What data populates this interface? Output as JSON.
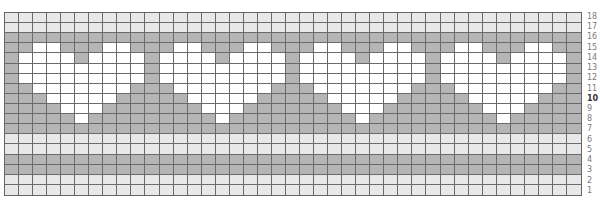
{
  "chart_data": {
    "type": "heatmap",
    "title": "",
    "columns": 41,
    "rows": 18,
    "row_labels": [
      "18",
      "17",
      "16",
      "15",
      "14",
      "13",
      "12",
      "11",
      "10",
      "9",
      "8",
      "7",
      "6",
      "5",
      "4",
      "3",
      "2",
      "1"
    ],
    "highlighted_row_label": "10",
    "colors": {
      "L": "#e8e8e8",
      "D": "#b5b5b5",
      "W": "#ffffff"
    },
    "legend": {
      "L": "light gray (background stripe)",
      "D": "dark gray (contrast)",
      "W": "white (heart motif)"
    },
    "heart_motif": {
      "width": 9,
      "repeat_every": 10,
      "first_column": 1,
      "count": 4,
      "rows_top_to_bottom": {
        "15": [
          1,
          2,
          6,
          7
        ],
        "14": [
          0,
          1,
          2,
          3,
          5,
          6,
          7,
          8
        ],
        "13": [
          0,
          1,
          2,
          3,
          4,
          5,
          6,
          7,
          8
        ],
        "12": [
          0,
          1,
          2,
          3,
          4,
          5,
          6,
          7,
          8
        ],
        "11": [
          1,
          2,
          3,
          4,
          5,
          6,
          7
        ],
        "10": [
          2,
          3,
          4,
          5,
          6
        ],
        "9": [
          3,
          4,
          5
        ],
        "8": [
          4
        ]
      }
    },
    "row_fill": {
      "18": "L",
      "17": "L",
      "16": "D",
      "15": "D",
      "14": "D",
      "13": "D",
      "12": "D",
      "11": "D",
      "10": "D",
      "9": "D",
      "8": "D",
      "7": "D",
      "6": "L",
      "5": "L",
      "4": "D",
      "3": "D",
      "2": "L",
      "1": "L"
    }
  }
}
